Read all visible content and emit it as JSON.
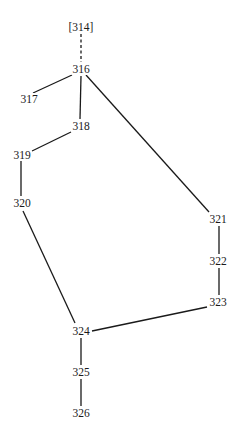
{
  "diagram": {
    "type": "genealogy-tree",
    "nodes": [
      {
        "id": "314",
        "label": "[314]",
        "x": 81,
        "y": 27
      },
      {
        "id": "316",
        "label": "316",
        "x": 81,
        "y": 69
      },
      {
        "id": "317",
        "label": "317",
        "x": 30,
        "y": 99
      },
      {
        "id": "318",
        "label": "318",
        "x": 81,
        "y": 126
      },
      {
        "id": "319",
        "label": "319",
        "x": 22,
        "y": 155
      },
      {
        "id": "320",
        "label": "320",
        "x": 22,
        "y": 203
      },
      {
        "id": "321",
        "label": "321",
        "x": 217,
        "y": 219
      },
      {
        "id": "322",
        "label": "322",
        "x": 217,
        "y": 261
      },
      {
        "id": "323",
        "label": "323",
        "x": 217,
        "y": 302
      },
      {
        "id": "324",
        "label": "324",
        "x": 81,
        "y": 331
      },
      {
        "id": "325",
        "label": "325",
        "x": 81,
        "y": 372
      },
      {
        "id": "326",
        "label": "326",
        "x": 81,
        "y": 413
      }
    ],
    "edges": [
      {
        "from": "314",
        "to": "316",
        "style": "dashed"
      },
      {
        "from": "316",
        "to": "317",
        "style": "solid"
      },
      {
        "from": "316",
        "to": "318",
        "style": "solid"
      },
      {
        "from": "316",
        "to": "321",
        "style": "solid"
      },
      {
        "from": "318",
        "to": "319",
        "style": "solid"
      },
      {
        "from": "319",
        "to": "320",
        "style": "solid"
      },
      {
        "from": "320",
        "to": "324",
        "style": "solid"
      },
      {
        "from": "321",
        "to": "322",
        "style": "solid"
      },
      {
        "from": "322",
        "to": "323",
        "style": "solid"
      },
      {
        "from": "323",
        "to": "324",
        "style": "solid"
      },
      {
        "from": "324",
        "to": "325",
        "style": "solid"
      },
      {
        "from": "325",
        "to": "326",
        "style": "solid"
      }
    ]
  }
}
